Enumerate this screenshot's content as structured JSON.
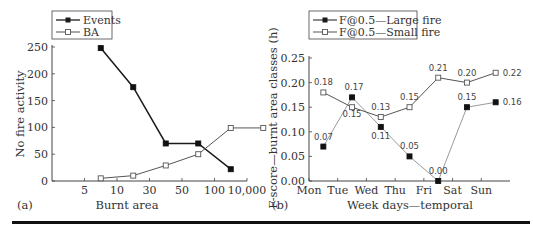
{
  "chart_data": [
    {
      "panel": "(a)",
      "type": "line",
      "title": "",
      "xlabel": "Burnt area",
      "ylabel": "No fire activity",
      "ylim": [
        0,
        250
      ],
      "yticks": [
        "0",
        "50",
        "100",
        "150",
        "200",
        "250"
      ],
      "xticks": [
        "5",
        "10",
        "30",
        "50",
        "100",
        "10,000"
      ],
      "legend_position": "top-left",
      "grid": false,
      "series": [
        {
          "name": "Events",
          "marker": "filled-square",
          "color": "#1a1a1a",
          "x": [
            1.5,
            2.5,
            3.5,
            4.5,
            5.5
          ],
          "values": [
            248,
            175,
            70,
            70,
            22
          ]
        },
        {
          "name": "BA",
          "marker": "open-square",
          "color": "#555555",
          "x": [
            1.5,
            2.5,
            3.5,
            4.5,
            5.5,
            6.5
          ],
          "values": [
            5,
            10,
            29,
            50,
            99,
            99
          ]
        }
      ]
    },
    {
      "panel": "(b)",
      "type": "line",
      "title": "",
      "xlabel": "Week days—temporal",
      "ylabel": "F-score—burnt area classes (h)",
      "ylim": [
        0,
        0.25
      ],
      "yticks": [
        "0.00",
        "0.05",
        "0.10",
        "0.15",
        "0.20",
        "0.25"
      ],
      "categories": [
        "Mon",
        "Tue",
        "Wed",
        "Thu",
        "Fri",
        "Sat",
        "Sun"
      ],
      "legend_position": "top",
      "grid": false,
      "series": [
        {
          "name": "F@0.5—Large fire",
          "marker": "filled-square",
          "color": "#9a9a9a",
          "x": [
            0.5,
            1.5,
            2.5,
            3.5,
            4.5,
            5.5,
            6.5
          ],
          "values": [
            0.07,
            0.17,
            0.11,
            0.05,
            0.0,
            0.15,
            0.16
          ],
          "labels": [
            "0.07",
            "0.17",
            "0.11",
            "0.05",
            "0.00",
            "0.15",
            "0.16"
          ]
        },
        {
          "name": "F@0.5—Small fire",
          "marker": "open-square",
          "color": "#555555",
          "x": [
            0.5,
            1.5,
            2.5,
            3.5,
            4.5,
            5.5,
            6.5
          ],
          "values": [
            0.18,
            0.15,
            0.13,
            0.15,
            0.21,
            0.2,
            0.22
          ],
          "labels": [
            "0.18",
            "0.15",
            "0.13",
            "0.15",
            "0.21",
            "0.20",
            "0.22"
          ]
        }
      ]
    }
  ],
  "panels": {
    "a": {
      "tag": "(a)",
      "xlabel": "Burnt area",
      "ylabel": "No fire activity",
      "legend": [
        "Events",
        "BA"
      ]
    },
    "b": {
      "tag": "(b)",
      "xlabel": "Week days—temporal",
      "ylabel": "F-score—burnt area classes (h)",
      "legend": [
        "F@0.5—Large fire",
        "F@0.5—Small fire"
      ]
    }
  }
}
